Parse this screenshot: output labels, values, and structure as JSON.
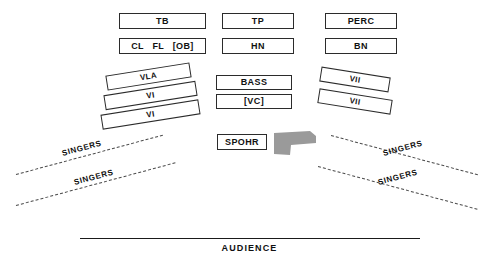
{
  "diagram": {
    "colors": {
      "box_border": "#2b2b2b",
      "box_fill": "#ffffff",
      "podium_fill": "#9a9a9a",
      "dashed_line": "#4a4a4a",
      "audience_line": "#1a1a1a",
      "text": "#111111"
    }
  },
  "back_rows": {
    "row1": [
      {
        "id": "tb",
        "label": "TB"
      },
      {
        "id": "tp",
        "label": "TP"
      },
      {
        "id": "perc",
        "label": "PERC"
      }
    ],
    "row2": [
      {
        "id": "woodwinds",
        "tokens": [
          "CL",
          "FL",
          "[OB]"
        ]
      },
      {
        "id": "hn",
        "label": "HN"
      },
      {
        "id": "bn",
        "label": "BN"
      }
    ]
  },
  "center": {
    "bass": {
      "label": "BASS"
    },
    "vc": {
      "label": "[VC]"
    },
    "spohr": {
      "label": "SPOHR"
    },
    "podium": {
      "name": "conductor-podium"
    }
  },
  "strings_left": [
    {
      "id": "vla",
      "label": "VLA"
    },
    {
      "id": "vi-1",
      "label": "VI"
    },
    {
      "id": "vi-2",
      "label": "VI"
    }
  ],
  "strings_right": [
    {
      "id": "vii-1",
      "label": "VII"
    },
    {
      "id": "vii-2",
      "label": "VII"
    }
  ],
  "singers": {
    "left": [
      {
        "id": "singers-left-1",
        "label": "SINGERS"
      },
      {
        "id": "singers-left-2",
        "label": "SINGERS"
      }
    ],
    "right": [
      {
        "id": "singers-right-1",
        "label": "SINGERS"
      },
      {
        "id": "singers-right-2",
        "label": "SINGERS"
      }
    ]
  },
  "audience": {
    "label": "AUDIENCE"
  }
}
